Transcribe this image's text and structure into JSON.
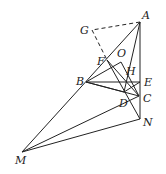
{
  "diagram": {
    "type": "geometry-figure",
    "points": {
      "A": {
        "label": "A",
        "x": 140,
        "y": 22
      },
      "G": {
        "label": "G",
        "x": 92,
        "y": 30
      },
      "F": {
        "label": "F",
        "x": 107,
        "y": 60
      },
      "O": {
        "label": "O",
        "x": 121,
        "y": 62
      },
      "B": {
        "label": "B",
        "x": 86,
        "y": 82
      },
      "H": {
        "label": "H",
        "x": 127,
        "y": 78
      },
      "E": {
        "label": "E",
        "x": 140,
        "y": 82
      },
      "D": {
        "label": "D",
        "x": 124,
        "y": 92
      },
      "C": {
        "label": "C",
        "x": 139,
        "y": 96
      },
      "N": {
        "label": "N",
        "x": 140,
        "y": 119
      },
      "M": {
        "label": "M",
        "x": 22,
        "y": 152
      }
    },
    "labels": [
      "A",
      "G",
      "F",
      "O",
      "B",
      "H",
      "E",
      "D",
      "C",
      "N",
      "M"
    ]
  }
}
